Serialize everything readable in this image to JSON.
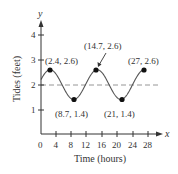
{
  "chart_data": {
    "type": "line",
    "title": "",
    "xlabel": "Time (hours)",
    "ylabel": "Tides (feet)",
    "x_axis_var": "x",
    "y_axis_var": "y",
    "xlim": [
      0,
      30
    ],
    "ylim": [
      0,
      4.5
    ],
    "x_ticks": [
      0,
      4,
      8,
      12,
      16,
      20,
      24,
      28
    ],
    "y_ticks": [
      1,
      2,
      3,
      4
    ],
    "grid": false,
    "legend": null,
    "series": [
      {
        "name": "tide",
        "kind": "sinusoid",
        "midline": 2,
        "amplitude": 0.6,
        "period": 12.3,
        "x_start": 0,
        "x_end": 27,
        "color": "#4a4a4a"
      }
    ],
    "reference_lines": [
      {
        "orientation": "horizontal",
        "y": 2,
        "style": "dashed",
        "color": "#888888"
      }
    ],
    "points": [
      {
        "x": 2.4,
        "y": 2.6,
        "label": "(2.4, 2.6)"
      },
      {
        "x": 8.7,
        "y": 1.4,
        "label": "(8.7, 1.4)"
      },
      {
        "x": 14.7,
        "y": 2.6,
        "label": "(14.7, 2.6)"
      },
      {
        "x": 21,
        "y": 1.4,
        "label": "(21, 1.4)"
      },
      {
        "x": 27,
        "y": 2.6,
        "label": "(27, 2.6)"
      }
    ]
  },
  "labels": {
    "x_title": "Time (hours)",
    "y_title": "Tides (feet)",
    "x_var": "x",
    "y_var": "y",
    "x_ticks": [
      "0",
      "4",
      "8",
      "12",
      "16",
      "20",
      "24",
      "28"
    ],
    "y_ticks": [
      "1",
      "2",
      "3",
      "4"
    ],
    "p1": "(2.4, 2.6)",
    "p2": "(8.7, 1.4)",
    "p3": "(14.7, 2.6)",
    "p4": "(21, 1.4)",
    "p5": "(27, 2.6)"
  }
}
